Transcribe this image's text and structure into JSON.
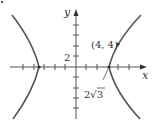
{
  "diagram": {
    "type": "hyperbola-graph",
    "axes": {
      "x_label": "x",
      "y_label": "y",
      "y_tick_label": "2"
    },
    "annotations": {
      "point_label": "(4, 4)",
      "vertex_label": "2√3"
    },
    "colors": {
      "axis": "#555555",
      "curve": "#555555",
      "text": "#333333"
    }
  }
}
